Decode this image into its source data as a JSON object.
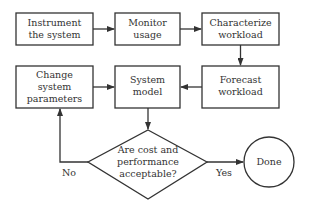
{
  "colors": {
    "stroke": "#333333",
    "text": "#333333",
    "background": "#ffffff"
  },
  "nodes": {
    "instrument": {
      "lines": [
        "Instrument",
        "the system"
      ]
    },
    "monitor": {
      "lines": [
        "Monitor",
        "usage"
      ]
    },
    "characterize": {
      "lines": [
        "Characterize",
        "workload"
      ]
    },
    "change": {
      "lines": [
        "Change",
        "system",
        "parameters"
      ]
    },
    "model": {
      "lines": [
        "System",
        "model"
      ]
    },
    "forecast": {
      "lines": [
        "Forecast",
        "workload"
      ]
    },
    "decision": {
      "lines": [
        "Are cost and",
        "performance",
        "acceptable?"
      ]
    },
    "done": {
      "label": "Done"
    }
  },
  "edge_labels": {
    "no": "No",
    "yes": "Yes"
  }
}
